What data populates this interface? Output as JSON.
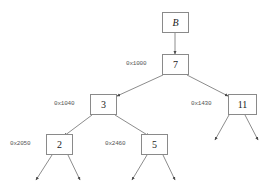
{
  "diagram": {
    "background_color": "#ffffff",
    "box_border_color": "#8a8a8a",
    "edge_color": "#6e6e6e",
    "address_text_color": "#555555",
    "value_text_color": "#1a1a1a"
  },
  "nodes": {
    "root_pointer": {
      "label": "B"
    },
    "n7": {
      "label": "7"
    },
    "n3": {
      "label": "3"
    },
    "n11": {
      "label": "11"
    },
    "n2": {
      "label": "2"
    },
    "n5": {
      "label": "5"
    }
  },
  "addresses": {
    "a7": "0x1000",
    "a3": "0x1040",
    "a11": "0x1430",
    "a2": "0x2050",
    "a5": "0x2460"
  },
  "edges": [
    {
      "from": "root_pointer",
      "to": "n7",
      "kind": "pointer"
    },
    {
      "from": "n7",
      "to": "n3",
      "kind": "child-left"
    },
    {
      "from": "n7",
      "to": "n11",
      "kind": "child-right"
    },
    {
      "from": "n3",
      "to": "n2",
      "kind": "child-left"
    },
    {
      "from": "n3",
      "to": "n5",
      "kind": "child-right"
    },
    {
      "from": "n2",
      "to": "null",
      "kind": "null-left"
    },
    {
      "from": "n2",
      "to": "null",
      "kind": "null-right"
    },
    {
      "from": "n5",
      "to": "null",
      "kind": "null-left"
    },
    {
      "from": "n5",
      "to": "null",
      "kind": "null-right"
    },
    {
      "from": "n11",
      "to": "null",
      "kind": "null-left"
    },
    {
      "from": "n11",
      "to": "null",
      "kind": "null-right"
    }
  ]
}
